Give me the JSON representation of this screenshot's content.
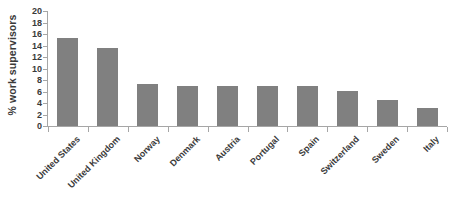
{
  "chart_data": {
    "type": "bar",
    "title": "",
    "subtitle": "",
    "xlabel": "",
    "ylabel": "% work supervisors",
    "ylim": [
      0,
      20
    ],
    "ytick_labels": [
      "0",
      "2",
      "4",
      "6",
      "8",
      "10",
      "12",
      "14",
      "16",
      "18",
      "20"
    ],
    "ytick_values": [
      0,
      2,
      4,
      6,
      8,
      10,
      12,
      14,
      16,
      18,
      20
    ],
    "grid": false,
    "legend": null,
    "legend_position": "none",
    "bar_color": "#808080",
    "axis_color": "#a6a6a6",
    "text_color": "#3a3a3a",
    "categories": [
      "United States",
      "United Kingdom",
      "Norway",
      "Denmark",
      "Austria",
      "Portugal",
      "Spain",
      "Switzerland",
      "Sweden",
      "Italy"
    ],
    "values": [
      15.3,
      13.6,
      7.3,
      7.0,
      6.9,
      6.9,
      6.9,
      6.1,
      4.5,
      3.1
    ]
  }
}
